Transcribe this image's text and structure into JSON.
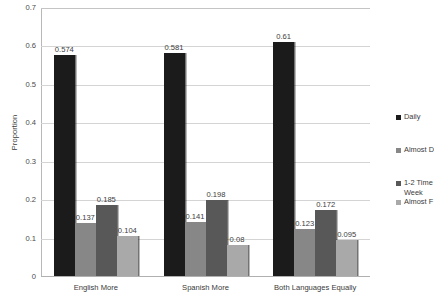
{
  "chart_data": {
    "type": "bar",
    "title": "",
    "subtitle": "",
    "xlabel": "",
    "ylabel": "Proportion",
    "ylim": [
      0,
      0.7
    ],
    "ytick_step": 0.1,
    "grid": true,
    "legend_position": "right",
    "categories": [
      "English More",
      "Spanish More",
      "Both Languages Equally"
    ],
    "ytick_labels": [
      "0",
      "0.1",
      "0.2",
      "0.3",
      "0.4",
      "0.5",
      "0.6",
      "0.7"
    ],
    "ytick_values": [
      0,
      0.1,
      0.2,
      0.3,
      0.4,
      0.5,
      0.6,
      0.7
    ],
    "series": [
      {
        "name": "Daily",
        "color": "#1b1b1b",
        "values": [
          0.574,
          0.581,
          0.61
        ],
        "labels": [
          "0.574",
          "0.581",
          "0.61"
        ]
      },
      {
        "name": "Almost D",
        "color": "#878787",
        "values": [
          0.137,
          0.141,
          0.123
        ],
        "labels": [
          "0.137",
          "0.141",
          "0.123"
        ]
      },
      {
        "name": "1-2 Time",
        "name_line2": "Week",
        "color": "#585858",
        "values": [
          0.185,
          0.198,
          0.172
        ],
        "labels": [
          "0.185",
          "0.198",
          "0.172"
        ]
      },
      {
        "name": "Almost F",
        "color": "#a9a9a9",
        "values": [
          0.104,
          0.08,
          0.095
        ],
        "labels": [
          "0.104",
          "0.08",
          "0.095"
        ]
      }
    ]
  },
  "axis": {
    "y_title": "Proportion"
  },
  "legend": {
    "items": [
      {
        "label": "Daily",
        "label2": "",
        "color": "#1b1b1b"
      },
      {
        "label": "Almost D",
        "label2": "",
        "color": "#878787"
      },
      {
        "label": "1-2 Time",
        "label2": "Week",
        "color": "#585858"
      },
      {
        "label": "Almost F",
        "label2": "",
        "color": "#a9a9a9"
      }
    ]
  },
  "colors": {
    "gridline": "#d4d4d4",
    "axis": "#b0b0b0",
    "text": "#3a3a3a",
    "background": "#ffffff"
  }
}
